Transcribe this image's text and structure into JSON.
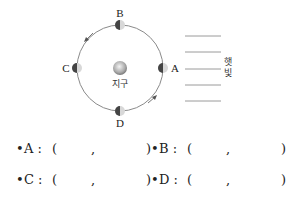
{
  "diagram": {
    "earth_label": "지구",
    "sunlight_label": [
      "햇",
      "빛"
    ],
    "moon_positions": [
      {
        "id": "A",
        "label": "A",
        "position": "right"
      },
      {
        "id": "B",
        "label": "B",
        "position": "top"
      },
      {
        "id": "C",
        "label": "C",
        "position": "left"
      },
      {
        "id": "D",
        "label": "D",
        "position": "bottom"
      }
    ],
    "light_ray_count": 5,
    "orbit_direction": "counterclockwise"
  },
  "answers": [
    {
      "bullet": "•",
      "name": "A :",
      "open": "(",
      "comma": ",",
      "close": ")"
    },
    {
      "bullet": "•",
      "name": "B :",
      "open": "(",
      "comma": ",",
      "close": ")"
    },
    {
      "bullet": "•",
      "name": "C :",
      "open": "(",
      "comma": ",",
      "close": ")"
    },
    {
      "bullet": "•",
      "name": "D :",
      "open": "(",
      "comma": ",",
      "close": ")"
    }
  ],
  "colors": {
    "orbit": "#8a8a8a",
    "moon_dark": "#444444",
    "moon_light": "#d8d8d8",
    "ray": "#9a9a9a"
  }
}
